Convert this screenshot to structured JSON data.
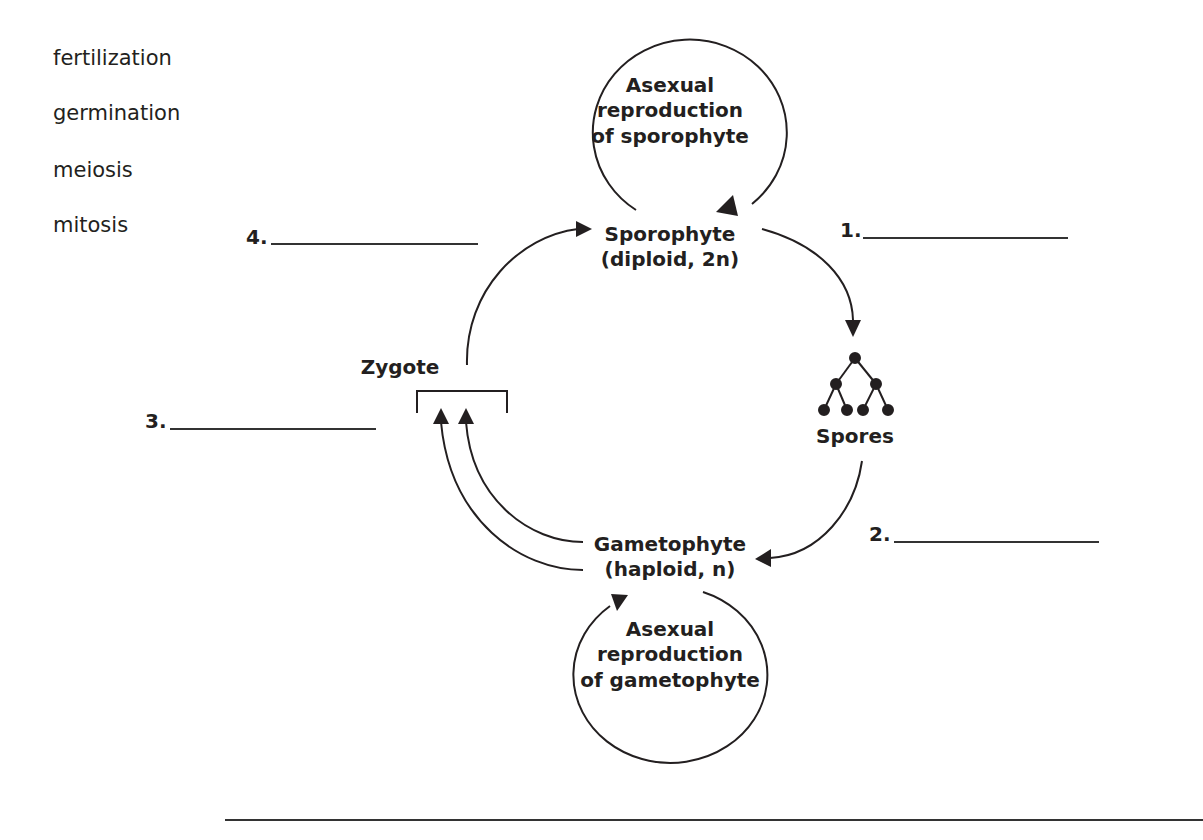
{
  "word_bank": {
    "items": [
      "fertilization",
      "germination",
      "meiosis",
      "mitosis"
    ]
  },
  "diagram": {
    "sporophyte": {
      "title": "Sporophyte",
      "subtitle": "(diploid, 2n)"
    },
    "gametophyte": {
      "title": "Gametophyte",
      "subtitle": "(haploid, n)"
    },
    "asexual_sporophyte": {
      "line1": "Asexual",
      "line2": "reproduction",
      "line3": "of sporophyte"
    },
    "asexual_gametophyte": {
      "line1": "Asexual",
      "line2": "reproduction",
      "line3": "of gametophyte"
    },
    "spores": {
      "label": "Spores"
    },
    "zygote": {
      "label": "Zygote"
    }
  },
  "blanks": [
    {
      "number": "1.",
      "value": ""
    },
    {
      "number": "2.",
      "value": ""
    },
    {
      "number": "3.",
      "value": ""
    },
    {
      "number": "4.",
      "value": ""
    }
  ],
  "colors": {
    "ink": "#231f20",
    "line": "#333333",
    "background": "#ffffff"
  }
}
